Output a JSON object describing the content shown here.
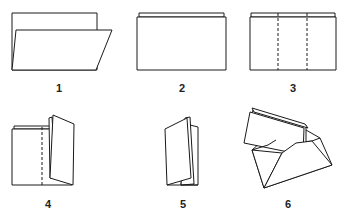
{
  "steps": [
    {
      "number": "1",
      "description": "sheet folded in half lengthwise, front flap tilted"
    },
    {
      "number": "2",
      "description": "folded sheet flat"
    },
    {
      "number": "3",
      "description": "fold lines marked in thirds (dashed)"
    },
    {
      "number": "4",
      "description": "right third folded upward along dashed line"
    },
    {
      "number": "5",
      "description": "accordion-folded letter"
    },
    {
      "number": "6",
      "description": "folded letter inserted into open envelope"
    }
  ],
  "colors": {
    "line": "#1a1a1a",
    "background": "#ffffff",
    "label": "#222222"
  }
}
